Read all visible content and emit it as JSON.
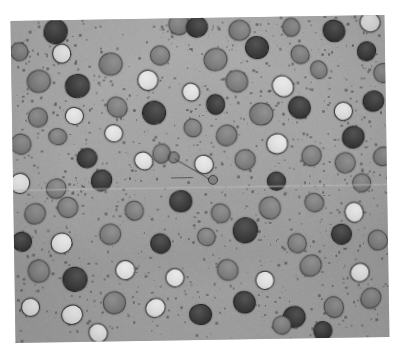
{
  "image": {
    "kind": "micrograph",
    "title": "Grayscale particle micrograph",
    "description": "Speckled gray matrix containing rounded second-phase particles of three tonal classes, with fine dark speckle halos, a faint horizontal scan seam and a thin two-segment annotation line near the centre.",
    "background_color": "#ffffff",
    "matrix_color": "#a9a9a9",
    "matrix_color_light": "#b4b4b4",
    "matrix_color_dark": "#9e9e9e"
  },
  "plate": {
    "left": 13,
    "top": 18,
    "width": 374,
    "height": 322,
    "rotation_deg": -0.9
  },
  "seam": {
    "y": 168,
    "label": "scan-seam"
  },
  "palette": {
    "dark": "#3b3b3b",
    "dark_rim": "#242424",
    "mid": "#7c7c7c",
    "mid_rim": "#4a4a4a",
    "light": "#dcdcdc",
    "light_rim": "#383838",
    "speck": "#4b4b4b"
  },
  "annotation": {
    "segments": [
      {
        "x": 162,
        "y": 140,
        "length": 40,
        "angle_deg": 31
      },
      {
        "x": 158,
        "y": 159,
        "length": 22,
        "angle_deg": 0
      }
    ],
    "node_a": {
      "x": 160,
      "y": 138,
      "r": 5
    },
    "node_b": {
      "x": 199,
      "y": 161,
      "r": 4
    }
  },
  "chart_data": {
    "type": "scatter",
    "xlabel": "",
    "ylabel": "",
    "classes": [
      {
        "name": "dark",
        "color": "#3b3b3b",
        "count": 33
      },
      {
        "name": "mid",
        "color": "#7c7c7c",
        "count": 35
      },
      {
        "name": "light",
        "color": "#dcdcdc",
        "count": 22
      }
    ],
    "grains": [
      {
        "x": 44,
        "y": 10,
        "r": 11,
        "t": "dark"
      },
      {
        "x": 167,
        "y": 5,
        "r": 9,
        "t": "mid"
      },
      {
        "x": 185,
        "y": 8,
        "r": 10,
        "t": "dark"
      },
      {
        "x": 228,
        "y": 12,
        "r": 10,
        "t": "mid"
      },
      {
        "x": 280,
        "y": 10,
        "r": 9,
        "t": "mid"
      },
      {
        "x": 322,
        "y": 14,
        "r": 10,
        "t": "dark"
      },
      {
        "x": 358,
        "y": 6,
        "r": 9,
        "t": "light"
      },
      {
        "x": 7,
        "y": 30,
        "r": 9,
        "t": "mid"
      },
      {
        "x": 50,
        "y": 32,
        "r": 9,
        "t": "light"
      },
      {
        "x": 99,
        "y": 44,
        "r": 11,
        "t": "mid"
      },
      {
        "x": 148,
        "y": 36,
        "r": 9,
        "t": "mid"
      },
      {
        "x": 204,
        "y": 41,
        "r": 10,
        "t": "mid"
      },
      {
        "x": 245,
        "y": 30,
        "r": 11,
        "t": "dark"
      },
      {
        "x": 288,
        "y": 37,
        "r": 9,
        "t": "mid"
      },
      {
        "x": 355,
        "y": 35,
        "r": 9,
        "t": "dark"
      },
      {
        "x": 27,
        "y": 60,
        "r": 10,
        "t": "mid"
      },
      {
        "x": 65,
        "y": 65,
        "r": 11,
        "t": "dark"
      },
      {
        "x": 136,
        "y": 60,
        "r": 9,
        "t": "light"
      },
      {
        "x": 178,
        "y": 73,
        "r": 9,
        "t": "light"
      },
      {
        "x": 224,
        "y": 63,
        "r": 10,
        "t": "mid"
      },
      {
        "x": 270,
        "y": 68,
        "r": 10,
        "t": "light"
      },
      {
        "x": 306,
        "y": 53,
        "r": 9,
        "t": "mid"
      },
      {
        "x": 371,
        "y": 57,
        "r": 9,
        "t": "mid"
      },
      {
        "x": 25,
        "y": 96,
        "r": 9,
        "t": "mid"
      },
      {
        "x": 62,
        "y": 95,
        "r": 9,
        "t": "light"
      },
      {
        "x": 104,
        "y": 87,
        "r": 10,
        "t": "mid"
      },
      {
        "x": 141,
        "y": 93,
        "r": 11,
        "t": "dark"
      },
      {
        "x": 203,
        "y": 86,
        "r": 9,
        "t": "dark"
      },
      {
        "x": 248,
        "y": 96,
        "r": 11,
        "t": "mid"
      },
      {
        "x": 286,
        "y": 90,
        "r": 10,
        "t": "dark"
      },
      {
        "x": 330,
        "y": 94,
        "r": 9,
        "t": "light"
      },
      {
        "x": 361,
        "y": 85,
        "r": 10,
        "t": "dark"
      },
      {
        "x": 8,
        "y": 122,
        "r": 9,
        "t": "mid"
      },
      {
        "x": 44,
        "y": 116,
        "r": 9,
        "t": "mid"
      },
      {
        "x": 100,
        "y": 113,
        "r": 9,
        "t": "light"
      },
      {
        "x": 180,
        "y": 109,
        "r": 9,
        "t": "mid"
      },
      {
        "x": 214,
        "y": 117,
        "r": 9,
        "t": "mid"
      },
      {
        "x": 264,
        "y": 126,
        "r": 10,
        "t": "light"
      },
      {
        "x": 340,
        "y": 120,
        "r": 10,
        "t": "dark"
      },
      {
        "x": 73,
        "y": 138,
        "r": 9,
        "t": "dark"
      },
      {
        "x": 130,
        "y": 141,
        "r": 9,
        "t": "light"
      },
      {
        "x": 148,
        "y": 134,
        "r": 8,
        "t": "mid"
      },
      {
        "x": 190,
        "y": 146,
        "r": 9,
        "t": "light"
      },
      {
        "x": 232,
        "y": 141,
        "r": 10,
        "t": "mid"
      },
      {
        "x": 298,
        "y": 138,
        "r": 9,
        "t": "mid"
      },
      {
        "x": 332,
        "y": 146,
        "r": 9,
        "t": "mid"
      },
      {
        "x": 370,
        "y": 140,
        "r": 9,
        "t": "mid"
      },
      {
        "x": 6,
        "y": 162,
        "r": 9,
        "t": "light"
      },
      {
        "x": 42,
        "y": 168,
        "r": 9,
        "t": "mid"
      },
      {
        "x": 88,
        "y": 160,
        "r": 10,
        "t": "dark"
      },
      {
        "x": 263,
        "y": 163,
        "r": 9,
        "t": "dark"
      },
      {
        "x": 348,
        "y": 167,
        "r": 9,
        "t": "mid"
      },
      {
        "x": 20,
        "y": 192,
        "r": 9,
        "t": "mid"
      },
      {
        "x": 54,
        "y": 186,
        "r": 10,
        "t": "mid"
      },
      {
        "x": 120,
        "y": 190,
        "r": 9,
        "t": "mid"
      },
      {
        "x": 166,
        "y": 182,
        "r": 11,
        "t": "dark"
      },
      {
        "x": 206,
        "y": 195,
        "r": 9,
        "t": "mid"
      },
      {
        "x": 255,
        "y": 190,
        "r": 10,
        "t": "mid"
      },
      {
        "x": 300,
        "y": 185,
        "r": 9,
        "t": "mid"
      },
      {
        "x": 339,
        "y": 196,
        "r": 10,
        "t": "light"
      },
      {
        "x": 7,
        "y": 220,
        "r": 9,
        "t": "dark"
      },
      {
        "x": 46,
        "y": 222,
        "r": 10,
        "t": "light"
      },
      {
        "x": 96,
        "y": 214,
        "r": 9,
        "t": "mid"
      },
      {
        "x": 145,
        "y": 224,
        "r": 10,
        "t": "dark"
      },
      {
        "x": 192,
        "y": 218,
        "r": 9,
        "t": "mid"
      },
      {
        "x": 230,
        "y": 212,
        "r": 11,
        "t": "dark"
      },
      {
        "x": 282,
        "y": 226,
        "r": 9,
        "t": "mid"
      },
      {
        "x": 327,
        "y": 218,
        "r": 10,
        "t": "dark"
      },
      {
        "x": 363,
        "y": 224,
        "r": 9,
        "t": "mid"
      },
      {
        "x": 24,
        "y": 250,
        "r": 10,
        "t": "mid"
      },
      {
        "x": 60,
        "y": 258,
        "r": 11,
        "t": "dark"
      },
      {
        "x": 110,
        "y": 250,
        "r": 9,
        "t": "light"
      },
      {
        "x": 160,
        "y": 258,
        "r": 9,
        "t": "light"
      },
      {
        "x": 212,
        "y": 252,
        "r": 10,
        "t": "mid"
      },
      {
        "x": 250,
        "y": 262,
        "r": 9,
        "t": "light"
      },
      {
        "x": 296,
        "y": 248,
        "r": 10,
        "t": "mid"
      },
      {
        "x": 344,
        "y": 256,
        "r": 9,
        "t": "light"
      },
      {
        "x": 14,
        "y": 286,
        "r": 9,
        "t": "light"
      },
      {
        "x": 56,
        "y": 294,
        "r": 9,
        "t": "light"
      },
      {
        "x": 98,
        "y": 282,
        "r": 10,
        "t": "mid"
      },
      {
        "x": 140,
        "y": 288,
        "r": 9,
        "t": "light"
      },
      {
        "x": 184,
        "y": 296,
        "r": 10,
        "t": "dark"
      },
      {
        "x": 228,
        "y": 284,
        "r": 10,
        "t": "dark"
      },
      {
        "x": 278,
        "y": 300,
        "r": 10,
        "t": "dark"
      },
      {
        "x": 318,
        "y": 290,
        "r": 10,
        "t": "mid"
      },
      {
        "x": 355,
        "y": 282,
        "r": 9,
        "t": "mid"
      },
      {
        "x": 82,
        "y": 312,
        "r": 9,
        "t": "light"
      },
      {
        "x": 266,
        "y": 308,
        "r": 9,
        "t": "mid"
      },
      {
        "x": 307,
        "y": 313,
        "r": 9,
        "t": "dark"
      }
    ]
  }
}
